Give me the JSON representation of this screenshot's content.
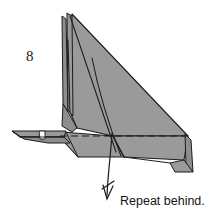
{
  "diagram": {
    "type": "origami-folding-instruction",
    "step_number": "8",
    "caption": "Repeat behind.",
    "background_color": "#ffffff",
    "paper_fill_color": "#9a9a9a",
    "paper_fill_color_shaded": "#8e8e8e",
    "paper_fill_color_light": "#a6a6a6",
    "line_color": "#1c1c1c",
    "fold_line_style": "dashed",
    "fold_line_meaning": "valley-fold",
    "arrow_symbol": "repeat-behind-arrow",
    "arrow_color": "#1c1c1c",
    "annotations": {
      "step_label": "8",
      "instruction": "Repeat behind."
    },
    "geometry_notes": {
      "main_shape": "tall right-leaning triangular wing form",
      "left_feature": "narrow layered vertical flap with two thin spikes at apex",
      "bottom_left_feature": "thin pointed beak with small white notch",
      "right_feature": "narrow tail flap descending at right edge",
      "crease_lines": "two near-parallel curved creases running from apex to base"
    }
  }
}
